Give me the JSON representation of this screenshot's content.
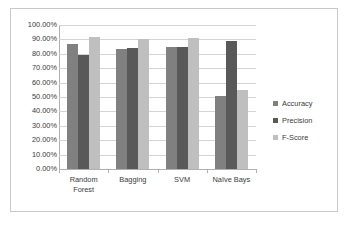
{
  "chart_data": {
    "type": "bar",
    "title": "",
    "xlabel": "",
    "ylabel": "",
    "ylim": [
      0,
      100
    ],
    "ytick_labels": [
      "100.00%",
      "90.00%",
      "80.00%",
      "70.00%",
      "60.00%",
      "50.00%",
      "40.00%",
      "30.00%",
      "20.00%",
      "10.00%",
      "0.00%"
    ],
    "ytick_values": [
      100,
      90,
      80,
      70,
      60,
      50,
      40,
      30,
      20,
      10,
      0
    ],
    "grid": true,
    "legend_position": "right",
    "categories": [
      "Random\nForest",
      "Bagging",
      "SVM",
      "Naïve Bays"
    ],
    "series": [
      {
        "name": "Accuracy",
        "color": "#808080",
        "values": [
          87.0,
          83.0,
          85.0,
          51.0
        ]
      },
      {
        "name": "Precision",
        "color": "#595959",
        "values": [
          79.0,
          84.0,
          85.0,
          89.0
        ]
      },
      {
        "name": "F-Score",
        "color": "#bfbfbf",
        "values": [
          91.5,
          90.0,
          91.0,
          55.0
        ]
      }
    ]
  }
}
